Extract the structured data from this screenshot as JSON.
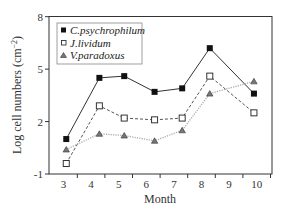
{
  "chart_data": {
    "type": "line",
    "title": "",
    "xlabel": "Month",
    "ylabel": "Log cell numbers (cm⁻²)",
    "ylabel_main": "Log cell numbers (cm",
    "ylabel_sup": "−2",
    "ylabel_close": ")",
    "x_tick_labels": [
      "3",
      "4",
      "5",
      "6",
      "7",
      "8",
      "9",
      "10"
    ],
    "y_ticks": [
      -1,
      2,
      5,
      8
    ],
    "y_tick_labels": [
      "-1",
      "2",
      "5",
      "8"
    ],
    "ylim": [
      -1,
      8
    ],
    "grid": false,
    "legend_position": "upper left",
    "x": [
      3.1,
      4.3,
      5.2,
      6.3,
      7.3,
      8.3,
      9.9
    ],
    "series": [
      {
        "name": "C.psychrophilum",
        "marker": "filled-square",
        "line_style": "solid",
        "color": "#333333",
        "values": [
          1.0,
          4.5,
          4.6,
          3.7,
          3.9,
          6.2,
          3.6
        ]
      },
      {
        "name": "J.lividum",
        "marker": "open-square",
        "line_style": "dashed",
        "color": "#555555",
        "values": [
          -0.4,
          2.9,
          2.2,
          2.1,
          2.2,
          4.6,
          2.5
        ]
      },
      {
        "name": "V.paradoxus",
        "marker": "triangle",
        "line_style": "dotted",
        "color": "#aaaaaa",
        "values": [
          0.4,
          1.3,
          1.2,
          0.9,
          1.5,
          3.6,
          4.3
        ]
      }
    ]
  },
  "legend": {
    "items": [
      {
        "label": "C.psychrophilum"
      },
      {
        "label": "J.lividum"
      },
      {
        "label": "V.paradoxus"
      }
    ]
  }
}
